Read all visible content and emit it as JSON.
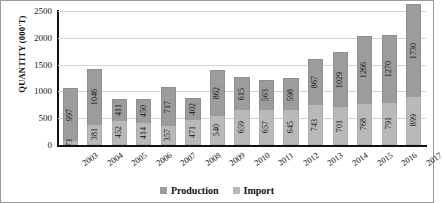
{
  "chart_data": {
    "type": "bar",
    "subtype": "stacked-bar",
    "title": "",
    "xlabel": "",
    "ylabel": "QUANTITY (000'T)",
    "ylim": [
      0,
      2500
    ],
    "yticks": [
      0,
      500,
      1000,
      1500,
      2000,
      2500
    ],
    "grid": true,
    "legend_position": "bottom",
    "categories": [
      "2003",
      "2004",
      "2005",
      "2006",
      "2007",
      "2008",
      "2009",
      "2010",
      "2011",
      "2012",
      "2013",
      "2014",
      "2015",
      "2016",
      "2017"
    ],
    "series": [
      {
        "name": "Production",
        "color": "#9c9c9c",
        "values": [
          997,
          1046,
          411,
          450,
          717,
          402,
          862,
          615,
          563,
          598,
          867,
          1029,
          1266,
          1270,
          1730
        ]
      },
      {
        "name": "Import",
        "color": "#b9b9b9",
        "values": [
          73,
          381,
          452,
          414,
          357,
          471,
          540,
          659,
          657,
          645,
          743,
          701,
          768,
          791,
          899
        ]
      }
    ]
  },
  "legend": {
    "items": [
      {
        "label": "Production",
        "color": "#9c9c9c"
      },
      {
        "label": "Import",
        "color": "#b9b9b9"
      }
    ]
  }
}
